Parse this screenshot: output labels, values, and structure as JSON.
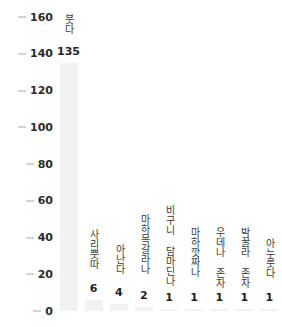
{
  "chart_data": {
    "type": "bar",
    "title": "",
    "xlabel": "",
    "ylabel": "",
    "ylim": [
      0,
      160
    ],
    "ytick_step": 20,
    "yticks": [
      "0",
      "20",
      "40",
      "60",
      "80",
      "100",
      "120",
      "140",
      "160"
    ],
    "grid": false,
    "legend": "none",
    "categories": [
      "붓다",
      "사리뿟따",
      "아난다",
      "마하목갈라나",
      "비구니 담마딘나",
      "마하깟짜나",
      "우데나 존자",
      "박꿀라 존자",
      "아누룻다"
    ],
    "values": [
      135,
      6,
      4,
      2,
      1,
      1,
      1,
      1,
      1
    ],
    "value_labels": [
      "135",
      "6",
      "4",
      "2",
      "1",
      "1",
      "1",
      "1",
      "1"
    ],
    "bar_color": "#f2f2f2",
    "label_color": "#3a3a3a",
    "value_color": "#1f1f1f",
    "tick_color": "#d3d3d3",
    "background": "#ffffff"
  }
}
